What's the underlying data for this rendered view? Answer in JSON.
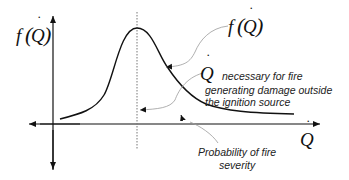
{
  "diagram": {
    "y_axis_label": {
      "func": "f",
      "var": "Q",
      "dot": "˙"
    },
    "x_axis_label": {
      "var": "Q",
      "dot": "˙"
    },
    "curve_label": {
      "func": "f",
      "var": "Q",
      "dot": "˙"
    },
    "q_dot_label": {
      "var": "Q",
      "dot": "˙"
    },
    "annotations": {
      "necessary": "necessary for fire",
      "generating_line1": "generating damage outside",
      "generating_line2": "the ignition source",
      "probability_line1": "Probability of fire",
      "probability_line2": "severity"
    },
    "colors": {
      "axis": "#111111",
      "curve": "#111111",
      "leader": "#9a9a9a",
      "dotted_line": "#777777"
    }
  }
}
